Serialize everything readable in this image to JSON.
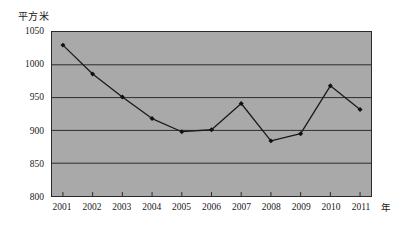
{
  "chart_data": {
    "type": "line",
    "title": "",
    "subtitle": "",
    "xlabel": "年",
    "ylabel": "平方米",
    "categories": [
      "2001",
      "2002",
      "2003",
      "2004",
      "2005",
      "2006",
      "2007",
      "2008",
      "2009",
      "2010",
      "2011"
    ],
    "values": [
      1030,
      986,
      951,
      918,
      898,
      901,
      941,
      884,
      895,
      968,
      932
    ],
    "series": [
      {
        "name": "",
        "values": [
          1030,
          986,
          951,
          918,
          898,
          901,
          941,
          884,
          895,
          968,
          932
        ]
      }
    ],
    "ylim": [
      800,
      1050
    ],
    "yticks": [
      800,
      850,
      900,
      950,
      1000,
      1050
    ],
    "ytick_labels": [
      "800",
      "850",
      "900",
      "950",
      "1000",
      "1050"
    ],
    "xtick_labels": [
      "2001",
      "2002",
      "2003",
      "2004",
      "2005",
      "2006",
      "2007",
      "2008",
      "2009",
      "2010",
      "2011"
    ],
    "grid": true,
    "grid_axis": "y",
    "legend": false,
    "legend_position": "none",
    "marker": "diamond",
    "annotations": []
  },
  "style": {
    "plot_background": "#a9a9a9",
    "page_background": "#ffffff",
    "grid_color": "#2b2b2b",
    "line_color": "#1a1a1a",
    "marker_color": "#111111",
    "axis_color": "#2b2b2b",
    "text_color": "#1a1a1a"
  }
}
